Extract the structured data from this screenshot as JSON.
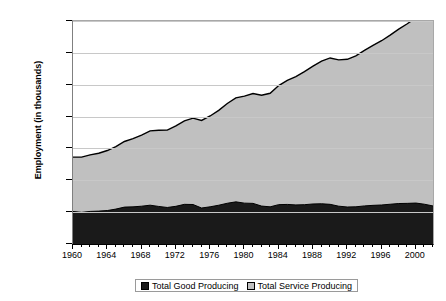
{
  "chart_data": {
    "type": "area",
    "stacked": true,
    "title": "",
    "xlabel": "",
    "ylabel": "Employment (in thousands)",
    "ylim": [
      0,
      140000
    ],
    "xlim": [
      1960,
      2002
    ],
    "grid": true,
    "legend_position": "bottom",
    "y_ticks": [
      "0",
      "20,000",
      "40,000",
      "60,000",
      "80,000",
      "100,000",
      "120,000",
      "140,000"
    ],
    "y_tick_values": [
      0,
      20000,
      40000,
      60000,
      80000,
      100000,
      120000,
      140000
    ],
    "x_ticks": [
      "1960",
      "1964",
      "1968",
      "1972",
      "1976",
      "1980",
      "1984",
      "1988",
      "1992",
      "1996",
      "2000"
    ],
    "x_tick_values": [
      1960,
      1964,
      1968,
      1972,
      1976,
      1980,
      1984,
      1988,
      1992,
      1996,
      2000
    ],
    "x": [
      1960,
      1961,
      1962,
      1963,
      1964,
      1965,
      1966,
      1967,
      1968,
      1969,
      1970,
      1971,
      1972,
      1973,
      1974,
      1975,
      1976,
      1977,
      1978,
      1979,
      1980,
      1981,
      1982,
      1983,
      1984,
      1985,
      1986,
      1987,
      1988,
      1989,
      1990,
      1991,
      1992,
      1993,
      1994,
      1995,
      1996,
      1997,
      1998,
      1999,
      2000,
      2001,
      2002
    ],
    "series": [
      {
        "name": "Total Good Producing",
        "color": "#1a1a1a",
        "values": [
          20434,
          19857,
          20451,
          20640,
          21005,
          21926,
          23158,
          23308,
          23737,
          24361,
          23578,
          22935,
          23668,
          24893,
          24794,
          22600,
          23352,
          24346,
          25585,
          26461,
          25658,
          25497,
          23812,
          23330,
          24718,
          24842,
          24533,
          24674,
          25125,
          25254,
          24905,
          23745,
          23231,
          23352,
          23908,
          24265,
          24493,
          24962,
          25414,
          25507,
          25709,
          24972,
          23879
        ]
      },
      {
        "name": "Total Service Producing",
        "color": "#c0c0c0",
        "values": [
          34127,
          34685,
          35510,
          36352,
          37683,
          39156,
          41204,
          42859,
          44674,
          46668,
          47790,
          48542,
          50456,
          52446,
          54191,
          54978,
          57021,
          59575,
          62617,
          65284,
          67215,
          68985,
          69596,
          71286,
          74740,
          77848,
          80541,
          83527,
          86588,
          89575,
          91894,
          91828,
          92728,
          94773,
          97690,
          100491,
          103128,
          106143,
          109472,
          112756,
          116263,
          117061,
          117640
        ]
      }
    ],
    "total_peak": {
      "year": 2000,
      "value": 131972
    }
  },
  "legend": {
    "items": [
      {
        "label": "Total Good Producing",
        "swatch": "#1a1a1a"
      },
      {
        "label": "Total Service Producing",
        "swatch": "#c0c0c0"
      }
    ]
  },
  "axis": {
    "y_title": "Employment (in thousands)"
  },
  "colors": {
    "goods": "#1a1a1a",
    "services": "#c0c0c0",
    "gridline": "#c8c8c8",
    "axis": "#000000",
    "plot_background": "#ffffff"
  }
}
